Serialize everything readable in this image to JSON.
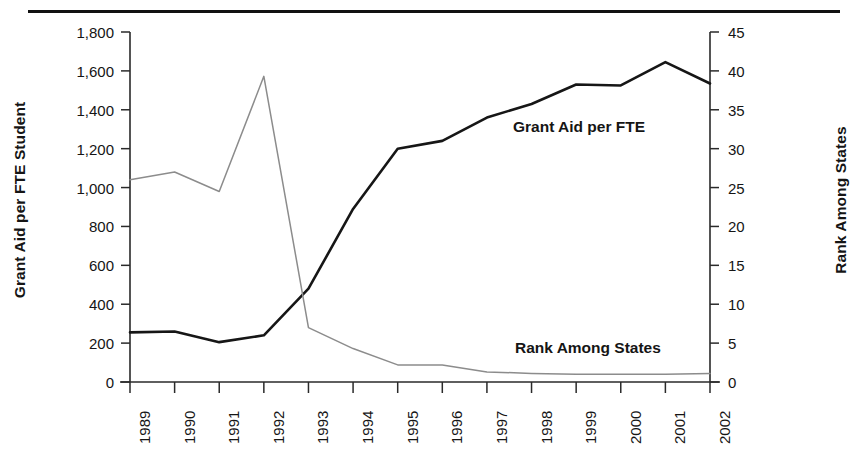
{
  "figure": {
    "background_color": "#ffffff",
    "top_rule_color": "#111111"
  },
  "chart_data": {
    "type": "line",
    "title": "",
    "xlabel": "",
    "ylabel": "Grant Aid per FTE Student",
    "y2label": "Rank Among States",
    "categories": [
      "1989",
      "1990",
      "1991",
      "1992",
      "1993",
      "1994",
      "1995",
      "1996",
      "1997",
      "1998",
      "1999",
      "2000",
      "2001",
      "2002"
    ],
    "x": [
      1989,
      1990,
      1991,
      1992,
      1993,
      1994,
      1995,
      1996,
      1997,
      1998,
      1999,
      2000,
      2001,
      2002
    ],
    "ylim": [
      0,
      1800
    ],
    "y2lim": [
      0,
      45
    ],
    "yticks": [
      0,
      200,
      400,
      600,
      800,
      1000,
      1200,
      1400,
      1600,
      1800
    ],
    "ytick_labels": [
      "0",
      "200",
      "400",
      "600",
      "800",
      "1,000",
      "1,200",
      "1,400",
      "1,600",
      "1,800"
    ],
    "y2ticks": [
      0,
      5,
      10,
      15,
      20,
      25,
      30,
      35,
      40,
      45
    ],
    "y2tick_labels": [
      "0",
      "5",
      "10",
      "15",
      "20",
      "25",
      "30",
      "35",
      "40",
      "45"
    ],
    "grid": false,
    "legend_position": "inline-annotation",
    "series": [
      {
        "name": "Grant Aid per FTE",
        "axis": "left",
        "color": "#161616",
        "line_width": 2.6,
        "values": [
          255,
          260,
          205,
          240,
          480,
          890,
          1200,
          1240,
          1360,
          1430,
          1530,
          1525,
          1645,
          1535
        ]
      },
      {
        "name": "Rank Among States",
        "axis": "right",
        "color": "#8c8c8c",
        "line_width": 1.5,
        "values": [
          26,
          27,
          24.5,
          39.3,
          7,
          4.3,
          2.2,
          2.2,
          1.3,
          1.1,
          1.0,
          1.0,
          1.0,
          1.1
        ]
      }
    ],
    "annotations": [
      {
        "text": "Grant Aid per FTE",
        "series": "Grant Aid per FTE"
      },
      {
        "text": "Rank Among States",
        "series": "Rank Among States"
      }
    ]
  }
}
